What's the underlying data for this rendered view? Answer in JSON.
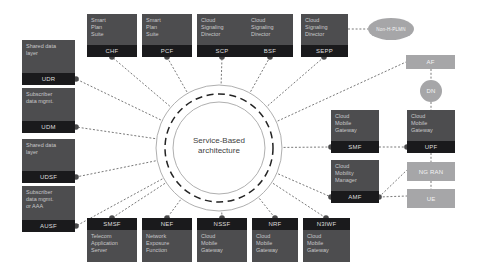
{
  "center": {
    "label": "Service-Based architecture"
  },
  "colors": {
    "node_fill": "#4d4d4f",
    "label_bar": "#1a1a1c",
    "external_gray": "#a6a6a8",
    "line": "#3f3f3f",
    "background": "#ffffff"
  },
  "nodes": {
    "udr": {
      "product": "Shared data layer",
      "nf": "UDR"
    },
    "udm": {
      "product": "Subscriber data mgmt.",
      "nf": "UDM"
    },
    "udsf": {
      "product": "Shared data layer",
      "nf": "UDSF"
    },
    "ausf": {
      "product": "Subscriber data mgmt. or AAA",
      "nf": "AUSF"
    },
    "chf": {
      "product": "Smart Plan Suite",
      "nf": "CHF"
    },
    "pcf": {
      "product": "Smart Plan Suite",
      "nf": "PCF"
    },
    "scp": {
      "product": "Cloud Signaling Director",
      "nf": "SCP"
    },
    "bsf": {
      "product": "Cloud Signaling Director",
      "nf": "BSF"
    },
    "sepp": {
      "product": "Cloud Signaling Director",
      "nf": "SEPP"
    },
    "smsf": {
      "product": "Telecom Application Server",
      "nf": "SMSF"
    },
    "nef": {
      "product": "Network Exposure Function",
      "nf": "NEF"
    },
    "nssf": {
      "product": "Cloud Mobile Gateway",
      "nf": "NSSF"
    },
    "nrf": {
      "product": "Cloud Mobile Gateway",
      "nf": "NRF"
    },
    "n3iwf": {
      "product": "Cloud Mobile Gateway",
      "nf": "N3IWF"
    },
    "smf": {
      "product": "Cloud Mobile Gateway",
      "nf": "SMF"
    },
    "amf": {
      "product": "Cloud Mobility Manager",
      "nf": "AMF"
    },
    "upf": {
      "product": "Cloud Mobile Gateway",
      "nf": "UPF"
    }
  },
  "externals": {
    "af": {
      "label": "AF"
    },
    "dn": {
      "label": "DN"
    },
    "ngran": {
      "label": "NG RAN"
    },
    "ue": {
      "label": "UE"
    },
    "plmn": {
      "label": "Non-H-PLMN"
    }
  }
}
